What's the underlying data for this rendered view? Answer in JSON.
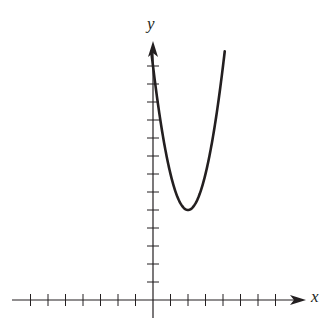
{
  "chart_data": {
    "type": "line",
    "title": "",
    "xlabel": "x",
    "ylabel": "y",
    "function": "y = 2(x - 2)^2 + 5",
    "vertex": [
      2,
      5
    ],
    "y_intercept": 13,
    "x_ticks": [
      -7,
      -6,
      -5,
      -4,
      -3,
      -2,
      -1,
      1,
      2,
      3,
      4,
      5,
      6,
      7
    ],
    "y_ticks": [
      1,
      2,
      3,
      4,
      5,
      6,
      7,
      8,
      9,
      10,
      11,
      12,
      13
    ],
    "tick_labels_shown": false,
    "xlim": [
      -7.8,
      8.4
    ],
    "ylim": [
      -1,
      14.3
    ],
    "grid": false,
    "series": [
      {
        "name": "parabola",
        "x": [
          -0.1,
          0,
          0.5,
          1,
          1.5,
          2,
          2.5,
          3,
          3.5,
          4,
          4.1
        ],
        "values": [
          13.82,
          13,
          9.5,
          7,
          5.5,
          5,
          5.5,
          7,
          9.5,
          13,
          13.82
        ]
      }
    ],
    "colors": {
      "axis": "#231f20",
      "curve": "#231f20",
      "background": "#ffffff"
    }
  },
  "labels": {
    "x": "x",
    "y": "y"
  }
}
